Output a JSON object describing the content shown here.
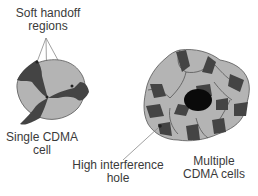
{
  "labels": {
    "soft_handoff_line1": "Soft handoff",
    "soft_handoff_line2": "regions",
    "single_cell_line1": "Single CDMA",
    "single_cell_line2": "cell",
    "interference_line1": "High interference",
    "interference_line2": "hole",
    "multiple_cells_line1": "Multiple",
    "multiple_cells_line2": "CDMA cells"
  },
  "colors": {
    "cell_fill": "#b4b4b4",
    "handoff_fill": "#444444",
    "hole_fill": "#0a0a0a",
    "outline": "#555555",
    "leader_line": "#888888"
  }
}
